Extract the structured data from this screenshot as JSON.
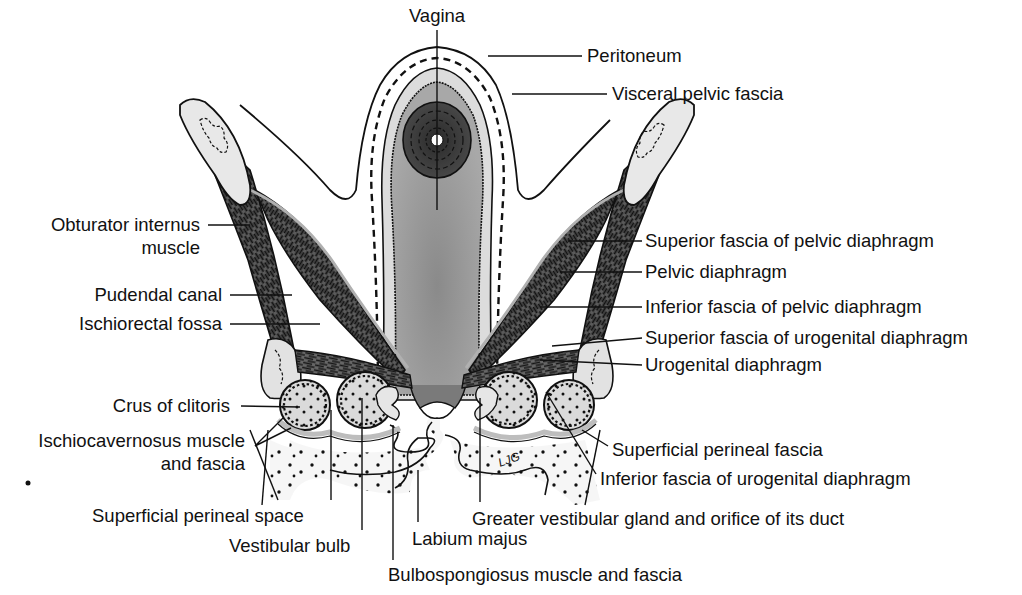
{
  "diagram": {
    "colors": {
      "background": "#ffffff",
      "ink": "#111111",
      "muscle": "#3a3a3a",
      "muscle_light": "#8c8c8c",
      "fascia": "#c8c8c8",
      "vagina_fill": "#9c9c9c",
      "vagina_wall": "#d6d6d6",
      "bone": "#e6e6e6",
      "erectile": "#dcdcdc",
      "fat": "#f4f4f4"
    },
    "labels": [
      {
        "id": "vagina",
        "text": "Vagina",
        "x": 437,
        "y": 22,
        "anchor": "middle",
        "line": [
          [
            437,
            30
          ],
          [
            437,
            210
          ]
        ]
      },
      {
        "id": "peritoneum",
        "text": "Peritoneum",
        "x": 587,
        "y": 62,
        "anchor": "start",
        "line": [
          [
            582,
            56
          ],
          [
            488,
            56
          ]
        ]
      },
      {
        "id": "visceral-pelvic-fascia",
        "text": "Visceral pelvic fascia",
        "x": 612,
        "y": 100,
        "anchor": "start",
        "line": [
          [
            607,
            94
          ],
          [
            512,
            94
          ]
        ]
      },
      {
        "id": "obturator-internus-muscle",
        "text": [
          "Obturator internus",
          "muscle"
        ],
        "x": 200,
        "y": 231,
        "anchor": "end",
        "line": [
          [
            208,
            225
          ],
          [
            250,
            225
          ]
        ]
      },
      {
        "id": "pudendal-canal",
        "text": "Pudendal canal",
        "x": 222,
        "y": 301,
        "anchor": "end",
        "line": [
          [
            230,
            295
          ],
          [
            292,
            295
          ]
        ]
      },
      {
        "id": "ischiorectal-fossa",
        "text": "Ischiorectal fossa",
        "x": 222,
        "y": 330,
        "anchor": "end",
        "line": [
          [
            230,
            324
          ],
          [
            320,
            324
          ]
        ]
      },
      {
        "id": "superior-fascia-pelvic-diaphragm",
        "text": "Superior fascia of pelvic diaphragm",
        "x": 645,
        "y": 247,
        "anchor": "start",
        "line": [
          [
            642,
            241
          ],
          [
            568,
            241
          ]
        ]
      },
      {
        "id": "pelvic-diaphragm",
        "text": "Pelvic diaphragm",
        "x": 645,
        "y": 278,
        "anchor": "start",
        "line": [
          [
            642,
            272
          ],
          [
            560,
            272
          ]
        ]
      },
      {
        "id": "inferior-fascia-pelvic-diaphragm",
        "text": "Inferior fascia of pelvic diaphragm",
        "x": 645,
        "y": 313,
        "anchor": "start",
        "line": [
          [
            642,
            307
          ],
          [
            540,
            307
          ]
        ]
      },
      {
        "id": "superior-fascia-urogenital-diaphragm",
        "text": "Superior fascia of urogenital diaphragm",
        "x": 645,
        "y": 344,
        "anchor": "start",
        "line": [
          [
            642,
            338
          ],
          [
            552,
            346
          ]
        ]
      },
      {
        "id": "urogenital-diaphragm",
        "text": "Urogenital diaphragm",
        "x": 645,
        "y": 371,
        "anchor": "start",
        "line": [
          [
            642,
            365
          ],
          [
            540,
            360
          ]
        ]
      },
      {
        "id": "crus-of-clitoris",
        "text": "Crus of clitoris",
        "x": 230,
        "y": 412,
        "anchor": "end",
        "line": [
          [
            241,
            406
          ],
          [
            300,
            407
          ]
        ]
      },
      {
        "id": "ischiocavernosus-muscle-fascia",
        "text": [
          "Ischiocavernosus muscle",
          "and fascia"
        ],
        "x": 245,
        "y": 447,
        "anchor": "end",
        "line": [
          [
            255,
            446
          ],
          [
            283,
            418
          ],
          [
            255,
            446
          ],
          [
            291,
            428
          ]
        ]
      },
      {
        "id": "superficial-perineal-fascia",
        "text": "Superficial perineal fascia",
        "x": 612,
        "y": 456,
        "anchor": "start",
        "line": [
          [
            608,
            446
          ],
          [
            582,
            430
          ]
        ]
      },
      {
        "id": "inferior-fascia-urogenital-diaphragm",
        "text": "Inferior fascia of urogenital diaphragm",
        "x": 600,
        "y": 485,
        "anchor": "start",
        "line": [
          [
            596,
            474
          ],
          [
            546,
            392
          ]
        ]
      },
      {
        "id": "superficial-perineal-space",
        "text": "Superficial perineal space",
        "x": 92,
        "y": 522,
        "anchor": "start",
        "line": [
          [
            331,
            500
          ],
          [
            331,
            410
          ]
        ]
      },
      {
        "id": "greater-vestibular-gland",
        "text": "Greater vestibular gland and orifice of its duct",
        "x": 472,
        "y": 525,
        "anchor": "start",
        "line": [
          [
            480,
            502
          ],
          [
            480,
            398
          ]
        ]
      },
      {
        "id": "vestibular-bulb",
        "text": "Vestibular bulb",
        "x": 229,
        "y": 552,
        "anchor": "start",
        "line": [
          [
            362,
            530
          ],
          [
            362,
            398
          ]
        ]
      },
      {
        "id": "labium-majus",
        "text": "Labium majus",
        "x": 412,
        "y": 545,
        "anchor": "start",
        "line": [
          [
            418,
            522
          ],
          [
            418,
            470
          ]
        ]
      },
      {
        "id": "bulbospongiosus-muscle-fascia",
        "text": "Bulbospongiosus muscle and fascia",
        "x": 388,
        "y": 581,
        "anchor": "start",
        "line": [
          [
            393,
            560
          ],
          [
            393,
            425
          ]
        ]
      }
    ],
    "artist_mark": "LJG"
  }
}
